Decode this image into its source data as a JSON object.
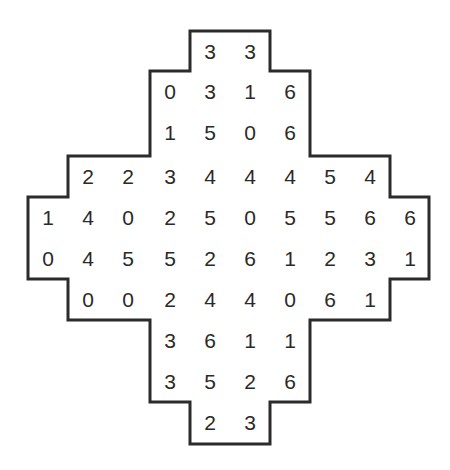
{
  "puzzle": {
    "type": "dominosa-style number grid",
    "border_color": "#2b2b2b",
    "text_color": "#2a2a2a",
    "rows": [
      {
        "start_col": 4,
        "values": [
          "3",
          "3"
        ]
      },
      {
        "start_col": 3,
        "values": [
          "0",
          "3",
          "1",
          "6"
        ]
      },
      {
        "start_col": 3,
        "values": [
          "1",
          "5",
          "0",
          "6"
        ]
      },
      {
        "start_col": 1,
        "values": [
          "2",
          "2",
          "3",
          "4",
          "4",
          "4",
          "5",
          "4"
        ]
      },
      {
        "start_col": 0,
        "values": [
          "1",
          "4",
          "0",
          "2",
          "5",
          "0",
          "5",
          "5",
          "6",
          "6"
        ]
      },
      {
        "start_col": 0,
        "values": [
          "0",
          "4",
          "5",
          "5",
          "2",
          "6",
          "1",
          "2",
          "3",
          "1"
        ]
      },
      {
        "start_col": 1,
        "values": [
          "0",
          "0",
          "2",
          "4",
          "4",
          "0",
          "6",
          "1"
        ]
      },
      {
        "start_col": 3,
        "values": [
          "3",
          "6",
          "1",
          "1"
        ]
      },
      {
        "start_col": 3,
        "values": [
          "3",
          "5",
          "2",
          "6"
        ]
      },
      {
        "start_col": 4,
        "values": [
          "2",
          "3"
        ]
      }
    ]
  }
}
